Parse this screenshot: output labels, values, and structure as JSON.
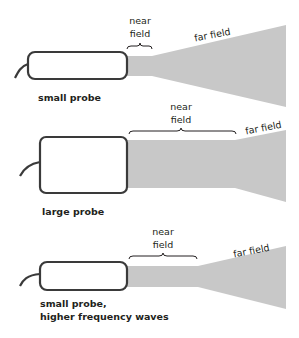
{
  "diagram": {
    "colors": {
      "beam": "#c8c8c8",
      "probe_stroke": "#3a3a3a",
      "probe_fill": "#ffffff",
      "text": "#231f20"
    },
    "panels": [
      {
        "id": "small-probe",
        "probe_label": "small probe",
        "near_field_label_line1": "near",
        "near_field_label_line2": "field",
        "far_field_label": "far field"
      },
      {
        "id": "large-probe",
        "probe_label": "large probe",
        "near_field_label_line1": "near",
        "near_field_label_line2": "field",
        "far_field_label": "far field"
      },
      {
        "id": "small-probe-high-freq",
        "probe_label_line1": "small probe,",
        "probe_label_line2": "higher frequency waves",
        "near_field_label_line1": "near",
        "near_field_label_line2": "field",
        "far_field_label": "far field"
      }
    ]
  }
}
